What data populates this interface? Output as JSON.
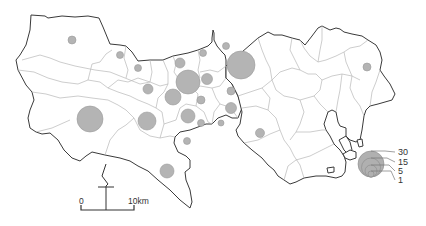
{
  "map": {
    "type": "proportional-symbol map",
    "legend": {
      "items": [
        {
          "value": "30",
          "r": 13
        },
        {
          "value": "15",
          "r": 9.5
        },
        {
          "value": "5",
          "r": 6
        },
        {
          "value": "1",
          "r": 3
        }
      ]
    },
    "scale_bar": {
      "start_label": "0",
      "end_label": "10km"
    },
    "north_arrow": "north-arrow",
    "symbols": [
      {
        "x": 72,
        "y": 40,
        "r": 4
      },
      {
        "x": 120,
        "y": 55,
        "r": 3.5
      },
      {
        "x": 138,
        "y": 68,
        "r": 3.5
      },
      {
        "x": 148,
        "y": 89,
        "r": 5
      },
      {
        "x": 90,
        "y": 119,
        "r": 13
      },
      {
        "x": 147,
        "y": 121,
        "r": 9
      },
      {
        "x": 180,
        "y": 63,
        "r": 5
      },
      {
        "x": 203,
        "y": 53,
        "r": 3.5
      },
      {
        "x": 207,
        "y": 79,
        "r": 5.5
      },
      {
        "x": 188,
        "y": 82,
        "r": 12
      },
      {
        "x": 173,
        "y": 97,
        "r": 8
      },
      {
        "x": 201,
        "y": 100,
        "r": 4
      },
      {
        "x": 188,
        "y": 116,
        "r": 7
      },
      {
        "x": 231,
        "y": 91,
        "r": 4
      },
      {
        "x": 231,
        "y": 108,
        "r": 5.5
      },
      {
        "x": 221,
        "y": 123,
        "r": 3
      },
      {
        "x": 241,
        "y": 65,
        "r": 14
      },
      {
        "x": 226,
        "y": 46,
        "r": 3.5
      },
      {
        "x": 260,
        "y": 133,
        "r": 4.5
      },
      {
        "x": 167,
        "y": 171,
        "r": 7
      },
      {
        "x": 367,
        "y": 67,
        "r": 4
      },
      {
        "x": 201,
        "y": 123,
        "r": 3.5
      },
      {
        "x": 187,
        "y": 141,
        "r": 3.5
      }
    ]
  }
}
